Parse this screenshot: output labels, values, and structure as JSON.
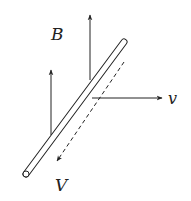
{
  "diagram": {
    "labels": {
      "magnetic_field": "B",
      "velocity": "v",
      "voltage": "V"
    },
    "elements": [
      {
        "name": "rod",
        "description": "conducting rod drawn as a thin cylinder, oriented diagonally"
      },
      {
        "name": "magnetic-field-arrow",
        "count": 2,
        "direction": "up"
      },
      {
        "name": "velocity-arrow",
        "direction": "right"
      },
      {
        "name": "voltage-arrow",
        "style": "dashed",
        "direction": "down-left along rod"
      }
    ],
    "colors": {
      "stroke": "#222222",
      "background": "#ffffff"
    }
  }
}
